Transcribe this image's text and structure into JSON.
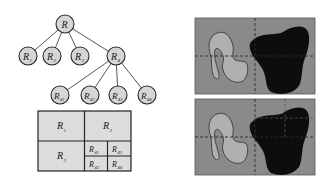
{
  "colors": {
    "node_fill": "#d6d6d6",
    "node_stroke": "#2a2a2a",
    "edge": "#444444",
    "cell_fill": "#dcdcdc",
    "grid_stroke": "#222222",
    "image_bg": "#8a8a8a",
    "light_region": "#b0b0b0",
    "light_region_outline": "#3a3a3a",
    "dark_region": "#0d0d0d",
    "dashed_line": "#2b2b2b"
  },
  "tree": {
    "root": {
      "id": "R",
      "label": "R",
      "sub": ""
    },
    "level1": [
      {
        "id": "R1",
        "label": "R",
        "sub": "1"
      },
      {
        "id": "R2",
        "label": "R",
        "sub": "2"
      },
      {
        "id": "R3",
        "label": "R",
        "sub": "3"
      },
      {
        "id": "R4",
        "label": "R",
        "sub": "4"
      }
    ],
    "level2": [
      {
        "id": "R41",
        "label": "R",
        "sub": "41"
      },
      {
        "id": "R42",
        "label": "R",
        "sub": "42"
      },
      {
        "id": "R43",
        "label": "R",
        "sub": "43"
      },
      {
        "id": "R44",
        "label": "R",
        "sub": "44"
      }
    ]
  },
  "grid": {
    "cells": [
      {
        "id": "R1",
        "label": "R",
        "sub": "1"
      },
      {
        "id": "R2",
        "label": "R",
        "sub": "2"
      },
      {
        "id": "R3",
        "label": "R",
        "sub": "3"
      },
      {
        "id": "R41",
        "label": "R",
        "sub": "41"
      },
      {
        "id": "R42",
        "label": "R",
        "sub": "42"
      },
      {
        "id": "R43",
        "label": "R",
        "sub": "43"
      },
      {
        "id": "R44",
        "label": "R",
        "sub": "44"
      }
    ]
  },
  "images": {
    "top": {
      "description": "image split into 4 quadrants with dashed lines"
    },
    "bottom": {
      "description": "image with further split of upper-right quadrant"
    }
  }
}
